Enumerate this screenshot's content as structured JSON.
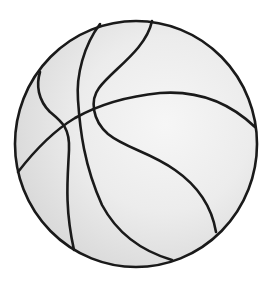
{
  "image": {
    "subject": "basketball line drawing",
    "caption": "Basketball",
    "colors": {
      "background": "#ffffff",
      "ball_fill": "#e4e4e4",
      "ball_highlight": "#f4f4f4",
      "line": "#1a1a1a"
    }
  }
}
